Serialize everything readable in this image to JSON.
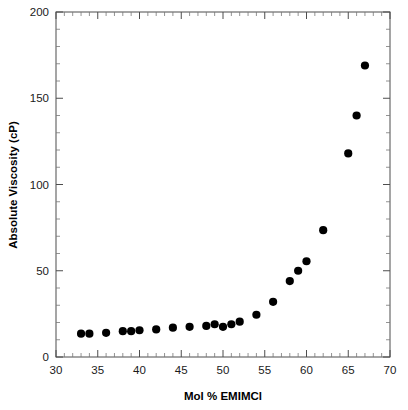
{
  "chart_data": {
    "type": "scatter",
    "title": "",
    "xlabel": "Mol % EMIMCl",
    "ylabel": "Absolute Viscosity (cP)",
    "xlim": [
      30,
      70
    ],
    "ylim": [
      0,
      200
    ],
    "grid": false,
    "legend": null,
    "x_major_ticks": [
      30,
      35,
      40,
      45,
      50,
      55,
      60,
      65,
      70
    ],
    "x_major_tick_labels": [
      "30",
      "35",
      "40",
      "45",
      "50",
      "55",
      "60",
      "65",
      "70"
    ],
    "x_minor_tick_step": 1,
    "y_major_ticks": [
      0,
      50,
      100,
      150,
      200
    ],
    "y_major_tick_labels": [
      "0",
      "50",
      "100",
      "150",
      "200"
    ],
    "y_minor_tick_step": 10,
    "marker": "filled-circle",
    "marker_color": "#000000",
    "series": [
      {
        "name": "Absolute Viscosity",
        "points": [
          {
            "x": 33.0,
            "y": 13.5
          },
          {
            "x": 34.0,
            "y": 13.5
          },
          {
            "x": 36.0,
            "y": 14.0
          },
          {
            "x": 38.0,
            "y": 15.0
          },
          {
            "x": 39.0,
            "y": 15.0
          },
          {
            "x": 40.0,
            "y": 15.5
          },
          {
            "x": 42.0,
            "y": 16.0
          },
          {
            "x": 44.0,
            "y": 17.0
          },
          {
            "x": 46.0,
            "y": 17.5
          },
          {
            "x": 48.0,
            "y": 18.0
          },
          {
            "x": 49.0,
            "y": 19.0
          },
          {
            "x": 50.0,
            "y": 17.5
          },
          {
            "x": 51.0,
            "y": 19.0
          },
          {
            "x": 52.0,
            "y": 20.5
          },
          {
            "x": 54.0,
            "y": 24.5
          },
          {
            "x": 56.0,
            "y": 32.0
          },
          {
            "x": 58.0,
            "y": 44.0
          },
          {
            "x": 59.0,
            "y": 50.0
          },
          {
            "x": 60.0,
            "y": 55.5
          },
          {
            "x": 62.0,
            "y": 73.5
          },
          {
            "x": 65.0,
            "y": 118.0
          },
          {
            "x": 66.0,
            "y": 140.0
          },
          {
            "x": 67.0,
            "y": 169.0
          }
        ]
      }
    ]
  },
  "axes": {
    "x_title": "Mol % EMIMCl",
    "y_title": "Absolute Viscosity (cP)"
  }
}
